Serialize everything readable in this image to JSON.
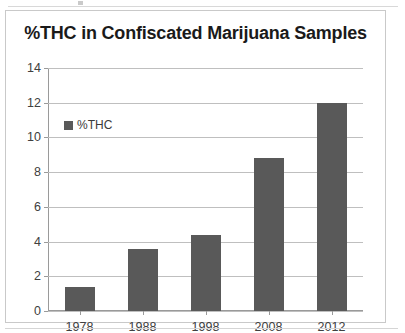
{
  "chart_data": {
    "type": "bar",
    "title": "%THC in Confiscated Marijuana Samples",
    "categories": [
      "1978",
      "1988",
      "1998",
      "2008",
      "2012"
    ],
    "values": [
      1.4,
      3.6,
      4.4,
      8.8,
      12.0
    ],
    "series": [
      {
        "name": "%THC",
        "values": [
          1.4,
          3.6,
          4.4,
          8.8,
          12.0
        ]
      }
    ],
    "xlabel": "",
    "ylabel": "",
    "ylim": [
      0,
      14
    ],
    "ytick_labels": [
      "0",
      "2",
      "4",
      "6",
      "8",
      "10",
      "12",
      "14"
    ],
    "ytick_values": [
      0,
      2,
      4,
      6,
      8,
      10,
      12,
      14
    ],
    "grid": true,
    "legend": {
      "position": "top-left-inside",
      "entries": [
        "%THC"
      ]
    },
    "colors": {
      "bar_fill": "#595959",
      "gridline": "#bfbfbf",
      "axis": "#9a9a9a",
      "title_text": "#1a1a1a",
      "tick_text": "#404040",
      "chart_border": "#c9c9c9",
      "background": "#ffffff"
    }
  }
}
